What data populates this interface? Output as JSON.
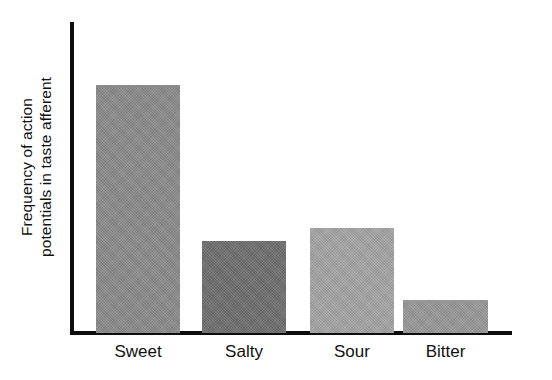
{
  "chart_data": {
    "type": "bar",
    "title": "",
    "subtitle": "",
    "xlabel": "",
    "ylabel": "Frequency of action potentials in taste afferent",
    "ylabel_line1": "Frequency of action",
    "ylabel_line2": "potentials in taste afferent",
    "categories": [
      "Sweet",
      "Salty",
      "Sour",
      "Bitter"
    ],
    "values": [
      80,
      30,
      34,
      11
    ],
    "ylim": [
      0,
      100
    ],
    "grid": false,
    "legend": null,
    "axis_ticks": [],
    "bars": [
      {
        "label": "Sweet",
        "value": 80,
        "color": "#8a8a8a",
        "height_px": 248
      },
      {
        "label": "Salty",
        "value": 30,
        "color": "#6e6e6e",
        "height_px": 92
      },
      {
        "label": "Sour",
        "value": 34,
        "color": "#a3a3a3",
        "height_px": 105
      },
      {
        "label": "Bitter",
        "value": 11,
        "color": "#979797",
        "height_px": 33
      }
    ]
  },
  "style": {
    "background": "#ffffff",
    "axis_color": "#0d0d0d",
    "text_color": "#111111"
  }
}
